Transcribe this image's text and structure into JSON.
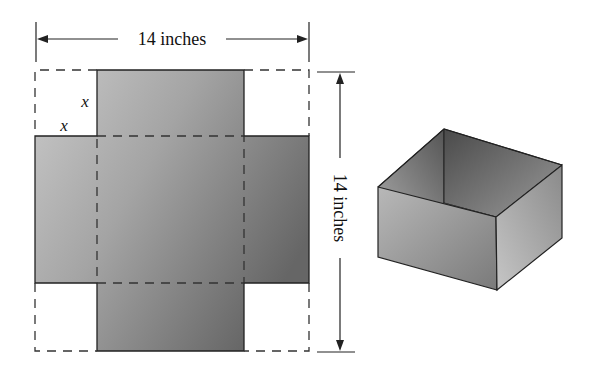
{
  "figure": {
    "type": "net-to-open-box",
    "net": {
      "width_label": "14 inches",
      "height_label": "14 inches",
      "cut_labels": [
        "x",
        "x"
      ],
      "sheet_size_in": 14,
      "cut_square_side": "x"
    },
    "box": {
      "description": "open-top box folded from net"
    },
    "colors": {
      "fill_light": "#c4c4c4",
      "fill_dark": "#6a6a6a",
      "line": "#222222",
      "background": "#ffffff"
    }
  }
}
